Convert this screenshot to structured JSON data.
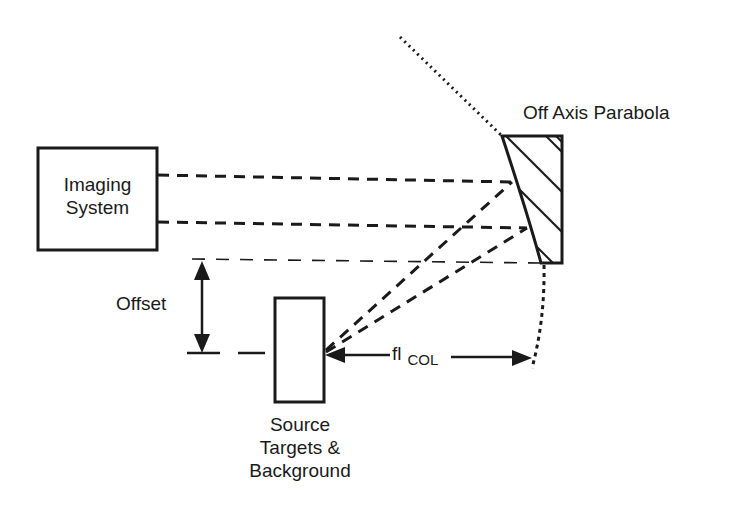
{
  "diagram": {
    "type": "optical-collimator-setup",
    "colors": {
      "stroke": "#1a1a1a",
      "background": "#ffffff"
    },
    "components": {
      "imaging_system": {
        "line1": "Imaging",
        "line2": "System"
      },
      "mirror": {
        "label": "Off Axis Parabola"
      },
      "source": {
        "line1": "Source",
        "line2": "Targets &",
        "line3": "Background"
      },
      "offset": {
        "label": "Offset"
      },
      "focal_length": {
        "label": "fl",
        "subscript": "COL"
      }
    }
  }
}
